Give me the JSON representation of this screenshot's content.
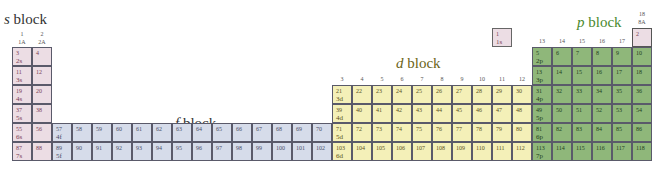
{
  "titles": {
    "s": {
      "letter": "s",
      "word": " block",
      "color": "#333333"
    },
    "d": {
      "letter": "d",
      "word": " block",
      "color": "#6b6418"
    },
    "f": {
      "letter": "f",
      "word": " block",
      "color": "#333333"
    },
    "p": {
      "letter": "p",
      "word": " block",
      "color": "#4a8a2e"
    }
  },
  "groups": [
    {
      "num": "1",
      "label": "1A"
    },
    {
      "num": "2",
      "label": "2A"
    },
    {
      "num": "3",
      "label": "3B"
    },
    {
      "num": "4",
      "label": "4B"
    },
    {
      "num": "5",
      "label": "5B"
    },
    {
      "num": "6",
      "label": "6B"
    },
    {
      "num": "7",
      "label": "7B"
    },
    {
      "num": "8",
      "label": "8B"
    },
    {
      "num": "9",
      "label": "8B"
    },
    {
      "num": "10",
      "label": "8B"
    },
    {
      "num": "11",
      "label": "1B"
    },
    {
      "num": "12",
      "label": "2B"
    },
    {
      "num": "13",
      "label": "3A"
    },
    {
      "num": "14",
      "label": "4A"
    },
    {
      "num": "15",
      "label": "5A"
    },
    {
      "num": "16",
      "label": "6A"
    },
    {
      "num": "17",
      "label": "7A"
    },
    {
      "num": "18",
      "label": "8A"
    }
  ],
  "colors": {
    "s": "#ecdde4",
    "f": "#d6dcea",
    "d": "#f4f0b8",
    "p": "#8fb77a"
  },
  "s_block": [
    {
      "z": "1",
      "orb": "1s"
    },
    {
      "z": "2",
      "orb": ""
    },
    {
      "z": "3",
      "orb": "2s"
    },
    {
      "z": "4",
      "orb": ""
    },
    {
      "z": "11",
      "orb": "3s"
    },
    {
      "z": "12",
      "orb": ""
    },
    {
      "z": "19",
      "orb": "4s"
    },
    {
      "z": "20",
      "orb": ""
    },
    {
      "z": "37",
      "orb": "5s"
    },
    {
      "z": "38",
      "orb": ""
    },
    {
      "z": "55",
      "orb": "6s"
    },
    {
      "z": "56",
      "orb": ""
    },
    {
      "z": "87",
      "orb": "7s"
    },
    {
      "z": "88",
      "orb": ""
    }
  ],
  "f_block": [
    [
      "57",
      "58",
      "59",
      "60",
      "61",
      "62",
      "63",
      "64",
      "65",
      "66",
      "67",
      "68",
      "69",
      "70"
    ],
    [
      "89",
      "90",
      "91",
      "92",
      "93",
      "94",
      "95",
      "96",
      "97",
      "98",
      "99",
      "100",
      "101",
      "102"
    ]
  ],
  "f_orbitals": [
    "4f",
    "5f"
  ],
  "d_block": [
    [
      "21",
      "22",
      "23",
      "24",
      "25",
      "26",
      "27",
      "28",
      "29",
      "30"
    ],
    [
      "39",
      "40",
      "41",
      "42",
      "43",
      "44",
      "45",
      "46",
      "47",
      "48"
    ],
    [
      "71",
      "72",
      "73",
      "74",
      "75",
      "76",
      "77",
      "78",
      "79",
      "80"
    ],
    [
      "103",
      "104",
      "105",
      "106",
      "107",
      "108",
      "109",
      "110",
      "111",
      "112"
    ]
  ],
  "d_orbitals": [
    "3d",
    "4d",
    "5d",
    "6d"
  ],
  "p_block": [
    [
      "5",
      "6",
      "7",
      "8",
      "9",
      "10"
    ],
    [
      "13",
      "14",
      "15",
      "16",
      "17",
      "18"
    ],
    [
      "31",
      "32",
      "33",
      "34",
      "35",
      "36"
    ],
    [
      "49",
      "50",
      "51",
      "52",
      "53",
      "54"
    ],
    [
      "81",
      "82",
      "83",
      "84",
      "85",
      "86"
    ],
    [
      "113",
      "114",
      "115",
      "116",
      "117",
      "118"
    ]
  ],
  "p_orbitals": [
    "2p",
    "3p",
    "4p",
    "5p",
    "6p",
    "7p"
  ]
}
